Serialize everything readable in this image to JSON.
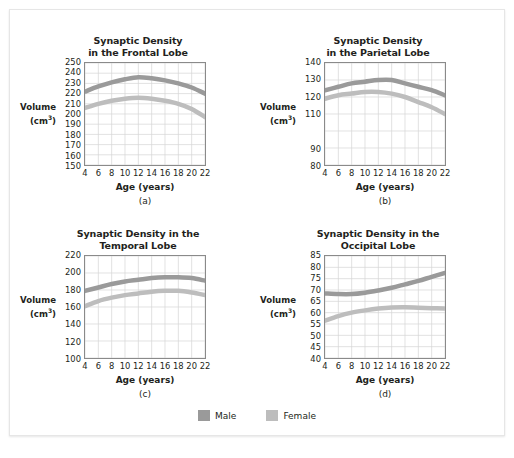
{
  "figure": {
    "background": "#ffffff",
    "card_border": "#e6e6e6"
  },
  "legend": {
    "items": [
      {
        "label": "Male",
        "color": "#9a9a9a"
      },
      {
        "label": "Female",
        "color": "#bdbdbd"
      }
    ]
  },
  "colors": {
    "male": "#9a9a9a",
    "female": "#bdbdbd",
    "grid": "#d6d6d6",
    "axis": "#8a8a8a",
    "text": "#231f20"
  },
  "chart_data": [
    {
      "type": "line",
      "id": "a",
      "panel_letter": "(a)",
      "title": "Synaptic Density\nin the Frontal Lobe",
      "xlabel": "Age (years)",
      "ylabel": "Volume",
      "ylabel_units": "(cm³)",
      "xlim": [
        4,
        22
      ],
      "ylim": [
        150,
        250
      ],
      "xticks": [
        4,
        6,
        8,
        10,
        12,
        14,
        16,
        18,
        20,
        22
      ],
      "yticks": [
        150,
        160,
        170,
        180,
        190,
        200,
        210,
        220,
        230,
        240,
        250
      ],
      "grid": true,
      "legend_position": "figure-bottom",
      "band_width": 4.5,
      "x": [
        4,
        6,
        8,
        10,
        12,
        14,
        16,
        18,
        20,
        22
      ],
      "series": [
        {
          "name": "Male",
          "color": "#9a9a9a",
          "values": [
            222,
            227,
            231,
            234,
            236,
            235,
            233,
            230,
            226,
            220
          ]
        },
        {
          "name": "Female",
          "color": "#bdbdbd",
          "values": [
            206,
            210,
            213,
            215,
            216,
            215,
            213,
            210,
            205,
            197
          ]
        }
      ]
    },
    {
      "type": "line",
      "id": "b",
      "panel_letter": "(b)",
      "title": "Synaptic Density\nin the Parietal Lobe",
      "xlabel": "Age (years)",
      "ylabel": "Volume",
      "ylabel_units": "(cm³)",
      "xlim": [
        4,
        22
      ],
      "ylim": [
        80,
        140
      ],
      "xticks": [
        4,
        6,
        8,
        10,
        12,
        14,
        16,
        18,
        20,
        22
      ],
      "yticks": [
        80,
        90,
        "",
        110,
        120,
        130,
        140
      ],
      "ytick_values": [
        80,
        90,
        100,
        110,
        120,
        130,
        140
      ],
      "grid": true,
      "legend_position": "figure-bottom",
      "band_width": 4.5,
      "x": [
        4,
        6,
        8,
        10,
        12,
        14,
        16,
        18,
        20,
        22
      ],
      "series": [
        {
          "name": "Male",
          "color": "#9a9a9a",
          "values": [
            124,
            126,
            128,
            129,
            130,
            130,
            128,
            126,
            124,
            121
          ]
        },
        {
          "name": "Female",
          "color": "#bdbdbd",
          "values": [
            119,
            121,
            122,
            123,
            123,
            122,
            120,
            117,
            114,
            110
          ]
        }
      ]
    },
    {
      "type": "line",
      "id": "c",
      "panel_letter": "(c)",
      "title": "Synaptic Density in the\nTemporal Lobe",
      "xlabel": "Age (years)",
      "ylabel": "Volume",
      "ylabel_units": "(cm³)",
      "xlim": [
        4,
        22
      ],
      "ylim": [
        100,
        220
      ],
      "xticks": [
        4,
        6,
        8,
        10,
        12,
        14,
        16,
        18,
        20,
        22
      ],
      "yticks": [
        100,
        120,
        140,
        160,
        180,
        200,
        220
      ],
      "grid": true,
      "legend_position": "figure-bottom",
      "band_width": 4.5,
      "x": [
        4,
        6,
        8,
        10,
        12,
        14,
        16,
        18,
        20,
        22
      ],
      "series": [
        {
          "name": "Male",
          "color": "#9a9a9a",
          "values": [
            179,
            183,
            187,
            190,
            192,
            194,
            195,
            195,
            194,
            191
          ]
        },
        {
          "name": "Female",
          "color": "#bdbdbd",
          "values": [
            161,
            167,
            171,
            174,
            176,
            178,
            179,
            179,
            177,
            174
          ]
        }
      ]
    },
    {
      "type": "line",
      "id": "d",
      "panel_letter": "(d)",
      "title": "Synaptic Density in the\nOccipital Lobe",
      "xlabel": "Age (years)",
      "ylabel": "Volume",
      "ylabel_units": "(cm³)",
      "xlim": [
        4,
        22
      ],
      "ylim": [
        40,
        85
      ],
      "xticks": [
        4,
        6,
        8,
        10,
        12,
        14,
        16,
        18,
        20,
        22
      ],
      "yticks": [
        40,
        45,
        50,
        55,
        60,
        65,
        70,
        75,
        80,
        85
      ],
      "grid": true,
      "legend_position": "figure-bottom",
      "band_width": 4.5,
      "x": [
        4,
        6,
        8,
        10,
        12,
        14,
        16,
        18,
        20,
        22
      ],
      "series": [
        {
          "name": "Male",
          "color": "#9a9a9a",
          "values": [
            68.5,
            68.2,
            68.2,
            68.8,
            69.8,
            71.0,
            72.5,
            74.0,
            75.8,
            77.5
          ]
        },
        {
          "name": "Female",
          "color": "#bdbdbd",
          "values": [
            56.5,
            58.5,
            60.0,
            61.0,
            61.8,
            62.3,
            62.4,
            62.2,
            62.0,
            61.8
          ]
        }
      ]
    }
  ]
}
